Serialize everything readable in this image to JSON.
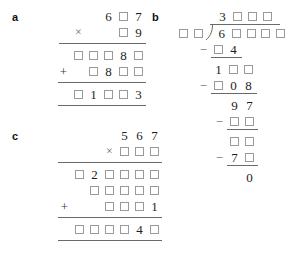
{
  "figure": {
    "type": "arithmetic-puzzle-worksheet",
    "box_symbol": "□",
    "colors": {
      "background": "#ffffff",
      "digit": "#1d1d1d",
      "box_border": "#9a9a9a",
      "rule": "#6a6a6a",
      "operator": "#6d6d6d",
      "label": "#111111"
    }
  },
  "parts": {
    "a": {
      "label": "a",
      "operation": "multiplication",
      "rows": [
        {
          "name": "multiplicand",
          "op": "",
          "cells": [
            "",
            "6",
            "□",
            "7"
          ]
        },
        {
          "name": "multiplier",
          "op": "×",
          "cells": [
            "",
            "□",
            "9"
          ]
        },
        {
          "name": "partial-product-1",
          "op": "",
          "cells": [
            "□",
            "□",
            "□",
            "8",
            "□"
          ]
        },
        {
          "name": "partial-product-2",
          "op": "+",
          "cells": [
            "□",
            "8",
            "□",
            "□"
          ]
        },
        {
          "name": "total",
          "op": "",
          "cells": [
            "□",
            "1",
            "□",
            "□",
            "3"
          ]
        }
      ]
    },
    "b": {
      "label": "b",
      "operation": "long-division",
      "quotient": {
        "name": "quotient",
        "cells": [
          "3",
          "□",
          "□",
          "□"
        ]
      },
      "divisor": {
        "name": "divisor",
        "cells": [
          "□",
          "□"
        ]
      },
      "dividend": {
        "name": "dividend",
        "cells": [
          "6",
          "□",
          "□",
          "□",
          "□"
        ]
      },
      "steps": [
        {
          "name": "subtract-1",
          "op": "−",
          "cells": [
            "□",
            "4"
          ]
        },
        {
          "name": "bring-down-1",
          "op": "",
          "cells": [
            "1",
            "□",
            "□"
          ]
        },
        {
          "name": "subtract-2",
          "op": "−",
          "cells": [
            "□",
            "0",
            "8"
          ]
        },
        {
          "name": "bring-down-2",
          "op": "",
          "cells": [
            "9",
            "7"
          ]
        },
        {
          "name": "subtract-3",
          "op": "−",
          "cells": [
            "□",
            "□"
          ]
        },
        {
          "name": "bring-down-3",
          "op": "",
          "cells": [
            "□",
            "□"
          ]
        },
        {
          "name": "subtract-4",
          "op": "−",
          "cells": [
            "7",
            "□"
          ]
        },
        {
          "name": "remainder",
          "op": "",
          "cells": [
            "0"
          ]
        }
      ]
    },
    "c": {
      "label": "c",
      "operation": "multiplication",
      "rows": [
        {
          "name": "multiplicand",
          "op": "",
          "cells": [
            "5",
            "6",
            "7"
          ]
        },
        {
          "name": "multiplier",
          "op": "×",
          "cells": [
            "□",
            "□",
            "□"
          ]
        },
        {
          "name": "partial-product-1",
          "op": "",
          "cells": [
            "□",
            "2",
            "□",
            "□",
            "□",
            "□"
          ]
        },
        {
          "name": "partial-product-2",
          "op": "",
          "cells": [
            "□",
            "□",
            "□",
            "□",
            "□"
          ]
        },
        {
          "name": "partial-product-3",
          "op": "+",
          "cells": [
            "□",
            "□",
            "□",
            "1"
          ]
        },
        {
          "name": "total",
          "op": "",
          "cells": [
            "□",
            "□",
            "□",
            "□",
            "4",
            "□"
          ]
        }
      ]
    }
  }
}
